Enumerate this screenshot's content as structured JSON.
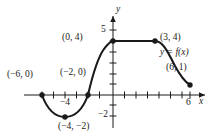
{
  "figure": {
    "kind": "function-graph",
    "background": "#ffffff",
    "ink": "#1a1a1a"
  },
  "axes": {
    "x_label": "x",
    "y_label": "y",
    "x_ticks_labeled": [
      {
        "value": 6,
        "text": "6"
      }
    ],
    "y_ticks_labeled": [
      {
        "value": 5,
        "text": "5"
      },
      {
        "value": -2,
        "text": "−2"
      }
    ],
    "x_axis_minor_label": "−4",
    "x_range": [
      -7,
      7
    ],
    "y_range": [
      -3,
      6
    ]
  },
  "curve": {
    "function_label": "y = f(x)",
    "description": "Piecewise curve: dips to a minimum at (−4,−2), rises through (−2,0) in an S to (0,4), flat at y=4 until (3,4), then decays to (6,1)."
  },
  "points": [
    {
      "id": "p-neg6-0",
      "text": "(−6, 0)",
      "x": -6,
      "y": 0
    },
    {
      "id": "p-neg4-neg2",
      "text": "(−4, −2)",
      "x": -4,
      "y": -2
    },
    {
      "id": "p-neg2-0",
      "text": "(−2, 0)",
      "x": -2,
      "y": 0
    },
    {
      "id": "p-0-4",
      "text": "(0, 4)",
      "x": 0,
      "y": 4
    },
    {
      "id": "p-3-4",
      "text": "(3, 4)",
      "x": 3,
      "y": 4
    },
    {
      "id": "p-6-1",
      "text": "(6, 1)",
      "x": 6,
      "y": 1
    }
  ]
}
